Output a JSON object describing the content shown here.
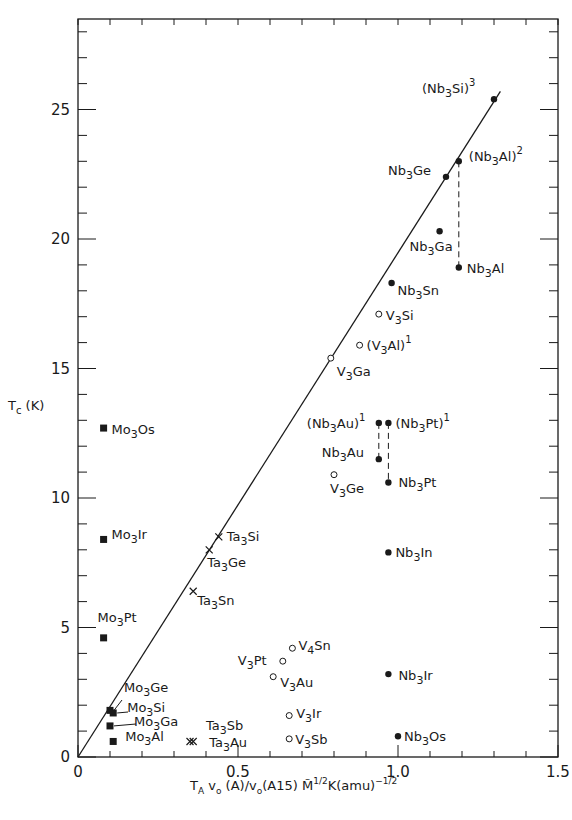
{
  "chart_data": {
    "type": "scatter",
    "title": "",
    "xlabel": "T_A v_0 (A)/v_0(A15) M̃^1/2 K(amu)^-1/2",
    "ylabel": "T_c (K)",
    "xlim": [
      0,
      1.5
    ],
    "ylim": [
      0,
      28.5
    ],
    "x_ticks": [
      "0",
      "0.5",
      "1.0",
      "1.5"
    ],
    "y_ticks": [
      "0",
      "5",
      "10",
      "15",
      "20",
      "25"
    ],
    "grid": false,
    "reference_line": {
      "from": [
        0,
        0
      ],
      "to": [
        1.32,
        25.7
      ]
    },
    "series": [
      {
        "name": "Nb3X",
        "marker": "filled-circle",
        "points": [
          {
            "label": "(Nb3Si)^3",
            "x": 1.3,
            "y": 25.4
          },
          {
            "label": "Nb3Ge",
            "x": 1.15,
            "y": 22.4
          },
          {
            "label": "(Nb3Al)^2",
            "x": 1.19,
            "y": 23.0
          },
          {
            "label": "Nb3Ga",
            "x": 1.13,
            "y": 20.3
          },
          {
            "label": "Nb3Al",
            "x": 1.19,
            "y": 18.9
          },
          {
            "label": "Nb3Sn",
            "x": 0.98,
            "y": 18.3
          },
          {
            "label": "(Nb3Au)^1",
            "x": 0.94,
            "y": 12.9
          },
          {
            "label": "(Nb3Pt)^1",
            "x": 0.97,
            "y": 12.9
          },
          {
            "label": "Nb3Au",
            "x": 0.94,
            "y": 11.5
          },
          {
            "label": "Nb3Pt",
            "x": 0.97,
            "y": 10.6
          },
          {
            "label": "Nb3In",
            "x": 0.97,
            "y": 7.9
          },
          {
            "label": "Nb3Ir",
            "x": 0.97,
            "y": 3.2
          },
          {
            "label": "Nb3Os",
            "x": 1.0,
            "y": 0.8
          }
        ]
      },
      {
        "name": "V3X",
        "marker": "open-circle",
        "points": [
          {
            "label": "V3Si",
            "x": 0.94,
            "y": 17.1
          },
          {
            "label": "(V3Al)^1",
            "x": 0.88,
            "y": 15.9
          },
          {
            "label": "V3Ga",
            "x": 0.79,
            "y": 15.4
          },
          {
            "label": "V3Ge",
            "x": 0.8,
            "y": 10.9
          },
          {
            "label": "V4Sn",
            "x": 0.67,
            "y": 4.2
          },
          {
            "label": "V3Pt",
            "x": 0.64,
            "y": 3.7
          },
          {
            "label": "V3Au",
            "x": 0.61,
            "y": 3.1
          },
          {
            "label": "V3Ir",
            "x": 0.66,
            "y": 1.6
          },
          {
            "label": "V3Sb",
            "x": 0.66,
            "y": 0.7
          }
        ]
      },
      {
        "name": "Ta3X",
        "marker": "cross",
        "points": [
          {
            "label": "Ta3Si",
            "x": 0.44,
            "y": 8.5
          },
          {
            "label": "Ta3Ge",
            "x": 0.41,
            "y": 8.0
          },
          {
            "label": "Ta3Sn",
            "x": 0.36,
            "y": 6.4
          },
          {
            "label": "Ta3Sb",
            "x": 0.35,
            "y": 0.6
          },
          {
            "label": "Ta3Au",
            "x": 0.36,
            "y": 0.6
          }
        ]
      },
      {
        "name": "Mo3X",
        "marker": "filled-square",
        "points": [
          {
            "label": "Mo3Os",
            "x": 0.08,
            "y": 12.7
          },
          {
            "label": "Mo3Ir",
            "x": 0.08,
            "y": 8.4
          },
          {
            "label": "Mo3Pt",
            "x": 0.08,
            "y": 4.6
          },
          {
            "label": "Mo3Ge",
            "x": 0.1,
            "y": 1.8
          },
          {
            "label": "Mo3Si",
            "x": 0.11,
            "y": 1.7
          },
          {
            "label": "Mo3Ga",
            "x": 0.1,
            "y": 1.2
          },
          {
            "label": "Mo3Al",
            "x": 0.11,
            "y": 0.6
          }
        ]
      }
    ],
    "tie_lines": [
      {
        "from": "(Nb3Al)^2",
        "to": "Nb3Al",
        "style": "dashed"
      },
      {
        "from": "(Nb3Au)^1",
        "to": "Nb3Au",
        "style": "dashed"
      },
      {
        "from": "(Nb3Pt)^1",
        "to": "Nb3Pt",
        "style": "dashed"
      }
    ]
  }
}
